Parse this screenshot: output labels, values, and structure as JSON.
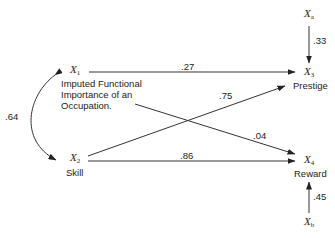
{
  "diagram": {
    "type": "path-diagram",
    "nodes": {
      "x1": {
        "symbol": "X",
        "sub": "1",
        "label_lines": [
          "Imputed Functional",
          "Importance of an",
          "Occupation."
        ]
      },
      "x2": {
        "symbol": "X",
        "sub": "2",
        "label": "Skill"
      },
      "x3": {
        "symbol": "X",
        "sub": "3",
        "label": "Prestige"
      },
      "x4": {
        "symbol": "X",
        "sub": "4",
        "label": "Reward"
      },
      "xa": {
        "symbol": "X",
        "sub": "a"
      },
      "xb": {
        "symbol": "X",
        "sub": "b"
      }
    },
    "edges": [
      {
        "from": "x1",
        "to": "x3",
        "coef": ".27"
      },
      {
        "from": "x1",
        "to": "x4",
        "coef": ".04"
      },
      {
        "from": "x2",
        "to": "x3",
        "coef": ".75"
      },
      {
        "from": "x2",
        "to": "x4",
        "coef": ".86"
      },
      {
        "from": "xa",
        "to": "x3",
        "coef": ".33"
      },
      {
        "from": "xb",
        "to": "x4",
        "coef": ".45"
      },
      {
        "from": "x1",
        "to": "x2",
        "coef": ".64",
        "bidirectional": true
      }
    ]
  }
}
